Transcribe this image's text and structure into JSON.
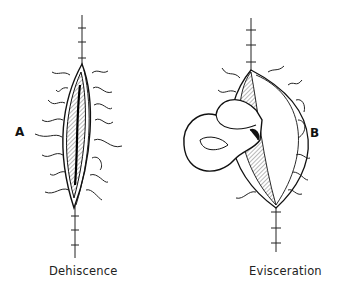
{
  "figure": {
    "panels": [
      {
        "letter": "A",
        "caption": "Dehiscence"
      },
      {
        "letter": "B",
        "caption": "Evisceration"
      }
    ]
  }
}
